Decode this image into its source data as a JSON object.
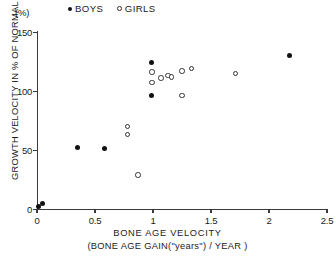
{
  "unit_label": "(%)",
  "legend": {
    "position": "top",
    "items": [
      {
        "label": "BOYS",
        "marker": "filled-circle",
        "color": "#111111"
      },
      {
        "label": "GIRLS",
        "marker": "open-circle",
        "color": "#333333"
      }
    ]
  },
  "axes": {
    "y_title": "GROWTH VELOCITY IN % OF NORMAL",
    "x_title": "BONE AGE VELOCITY",
    "x_subtitle": "(BONE AGE GAIN(\"years\") / YEAR )",
    "y_ticks": [
      "150",
      "100",
      "50",
      "0"
    ],
    "x_ticks": [
      "0",
      "0.5",
      "1",
      "1.5",
      "2",
      "2.5"
    ]
  },
  "chart_data": {
    "type": "scatter",
    "title": "",
    "xlabel": "BONE AGE VELOCITY (BONE AGE GAIN(\"years\") / YEAR )",
    "ylabel": "GROWTH VELOCITY IN % OF NORMAL",
    "xlim": [
      0,
      2.5
    ],
    "ylim": [
      0,
      150
    ],
    "x_ticks": [
      0,
      0.5,
      1,
      1.5,
      2,
      2.5
    ],
    "y_ticks": [
      0,
      50,
      100,
      150
    ],
    "grid": false,
    "legend_position": "top",
    "series": [
      {
        "name": "BOYS",
        "marker": "filled-circle",
        "color": "#111111",
        "points": [
          {
            "x": 0.01,
            "y": 2
          },
          {
            "x": 0.05,
            "y": 5
          },
          {
            "x": 0.35,
            "y": 52
          },
          {
            "x": 0.58,
            "y": 51
          },
          {
            "x": 0.99,
            "y": 124
          },
          {
            "x": 0.99,
            "y": 96
          },
          {
            "x": 2.18,
            "y": 130
          }
        ]
      },
      {
        "name": "GIRLS",
        "marker": "open-circle",
        "color": "#333333",
        "points": [
          {
            "x": 0.78,
            "y": 70
          },
          {
            "x": 0.78,
            "y": 63
          },
          {
            "x": 0.87,
            "y": 29
          },
          {
            "x": 0.99,
            "y": 116
          },
          {
            "x": 0.99,
            "y": 107
          },
          {
            "x": 1.07,
            "y": 111
          },
          {
            "x": 1.13,
            "y": 113
          },
          {
            "x": 1.16,
            "y": 112
          },
          {
            "x": 1.25,
            "y": 117
          },
          {
            "x": 1.33,
            "y": 119
          },
          {
            "x": 1.25,
            "y": 96
          },
          {
            "x": 1.71,
            "y": 115
          }
        ]
      }
    ]
  }
}
